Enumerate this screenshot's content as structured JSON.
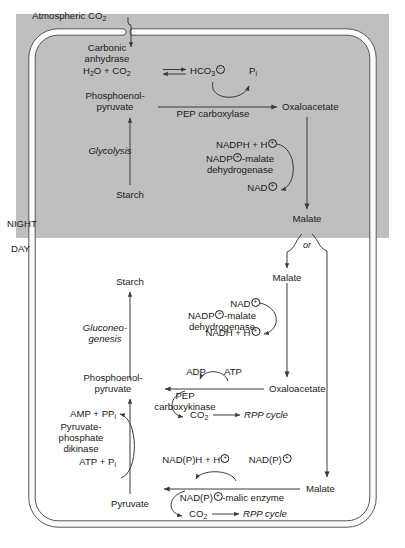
{
  "diagram": {
    "phases": {
      "night_label": "NIGHT",
      "day_label": "DAY"
    },
    "colors": {
      "night_background": "#bfbfbf",
      "day_background": "#ffffff",
      "line": "#3a3a3a",
      "text": "#1a1a1a"
    },
    "external": {
      "atmospheric_co2": "Atmospheric CO",
      "atmospheric_co2_sub": "2"
    }
  },
  "night": {
    "carbonic_anhydrase": {
      "line1": "Carbonic",
      "line2": "anhydrase"
    },
    "hydration": {
      "water": "H",
      "water_sub": "2",
      "water_rest": "O + CO",
      "water_rest_sub": "2",
      "product": "HCO",
      "product_sub": "3",
      "product_charge": "−"
    },
    "pi": {
      "text": "P",
      "sub": "i"
    },
    "pep": {
      "line1": "Phosphoenol-",
      "line2": "pyruvate"
    },
    "pep_carboxylase": "PEP carboxylase",
    "oxaloacetate": "Oxaloacetate",
    "glycolysis": "Glycolysis",
    "starch": "Starch",
    "mdh": {
      "substrate": "NADPH + H",
      "substrate_charge": "+",
      "enzyme_line1_a": "NADP",
      "enzyme_line1_charge": "+",
      "enzyme_line1_b": "-malate",
      "enzyme_line2": "dehydrogenase",
      "product": "NAD",
      "product_charge": "+"
    },
    "malate": "Malate"
  },
  "branch": {
    "or_label": "or"
  },
  "day": {
    "malate_left": "Malate",
    "mdh": {
      "substrate": "NAD",
      "substrate_charge": "+",
      "enzyme_line1_a": "NADP",
      "enzyme_line1_charge": "+",
      "enzyme_line1_b": "-malate",
      "enzyme_line2": "dehydrogenase",
      "product": "NADH + H",
      "product_charge": "+"
    },
    "oxaloacetate": "Oxaloacetate",
    "adp": "ADP",
    "atp": "ATP",
    "pepck_line1": "PEP",
    "pepck_line2": "carboxykinase",
    "co2_1": "CO",
    "co2_1_sub": "2",
    "rpp_1": "RPP cycle",
    "pep": {
      "line1": "Phosphoenol-",
      "line2": "pyruvate"
    },
    "gluconeogenesis": {
      "line1": "Gluconeo-",
      "line2": "genesis"
    },
    "starch": "Starch",
    "amp": {
      "text": "AMP + PP",
      "sub": "i"
    },
    "ppdk": {
      "line1": "Pyruvate-",
      "line2": "phosphate",
      "line3": "dikinase"
    },
    "atp_pi": {
      "text": "ATP + P",
      "sub": "i"
    },
    "pyruvate": "Pyruvate",
    "malic_substrate": {
      "text": "NAD(P)",
      "charge": "+"
    },
    "malic_product": {
      "text": "NAD(P)H + H",
      "charge": "+"
    },
    "malic_enzyme": {
      "a": "NAD(P)",
      "charge": "+",
      "b": "-malic enzyme"
    },
    "co2_2": "CO",
    "co2_2_sub": "2",
    "rpp_2": "RPP cycle",
    "malate_right": "Malate"
  }
}
